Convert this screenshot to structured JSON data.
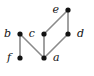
{
  "figure": {
    "title": "",
    "background_color": "#ffffff",
    "width": 94,
    "height": 76
  },
  "chart_data": {
    "type": "diagram",
    "diagram_kind": "hasse-diagram",
    "title": "",
    "xlabel": "",
    "ylabel": "",
    "node_color": "#121212",
    "edge_color": "#8a8a8a",
    "label_color": "#111111",
    "label_style": "italic-serif",
    "node_radius": 2.6,
    "edge_width": 1.6,
    "levels": [
      {
        "y": 10,
        "nodes": [
          "e"
        ]
      },
      {
        "y": 34,
        "nodes": [
          "b",
          "c",
          "d"
        ]
      },
      {
        "y": 58,
        "nodes": [
          "f",
          "a"
        ]
      }
    ],
    "nodes": [
      {
        "id": "e",
        "label": "e",
        "x": 68,
        "y": 10,
        "label_x": 59,
        "label_y": 10,
        "label_side": "left"
      },
      {
        "id": "b",
        "label": "b",
        "x": 20,
        "y": 34,
        "label_x": 11,
        "label_y": 34,
        "label_side": "left"
      },
      {
        "id": "c",
        "label": "c",
        "x": 44,
        "y": 34,
        "label_x": 35,
        "label_y": 34,
        "label_side": "left"
      },
      {
        "id": "d",
        "label": "d",
        "x": 68,
        "y": 34,
        "label_x": 77,
        "label_y": 34,
        "label_side": "right"
      },
      {
        "id": "f",
        "label": "f",
        "x": 20,
        "y": 58,
        "label_x": 11,
        "label_y": 58,
        "label_side": "left"
      },
      {
        "id": "a",
        "label": "a",
        "x": 44,
        "y": 58,
        "label_x": 53,
        "label_y": 58,
        "label_side": "right"
      }
    ],
    "edges": [
      {
        "id": "edge-b-f",
        "from": "b",
        "to": "f",
        "x1": 20,
        "y1": 34,
        "x2": 20,
        "y2": 58
      },
      {
        "id": "edge-b-a",
        "from": "b",
        "to": "a",
        "x1": 20,
        "y1": 34,
        "x2": 44,
        "y2": 58
      },
      {
        "id": "edge-c-a",
        "from": "c",
        "to": "a",
        "x1": 44,
        "y1": 34,
        "x2": 44,
        "y2": 58
      },
      {
        "id": "edge-c-e",
        "from": "c",
        "to": "e",
        "x1": 44,
        "y1": 34,
        "x2": 68,
        "y2": 10
      },
      {
        "id": "edge-e-d",
        "from": "e",
        "to": "d",
        "x1": 68,
        "y1": 10,
        "x2": 68,
        "y2": 34
      },
      {
        "id": "edge-d-a",
        "from": "d",
        "to": "a",
        "x1": 68,
        "y1": 34,
        "x2": 44,
        "y2": 58
      }
    ]
  }
}
